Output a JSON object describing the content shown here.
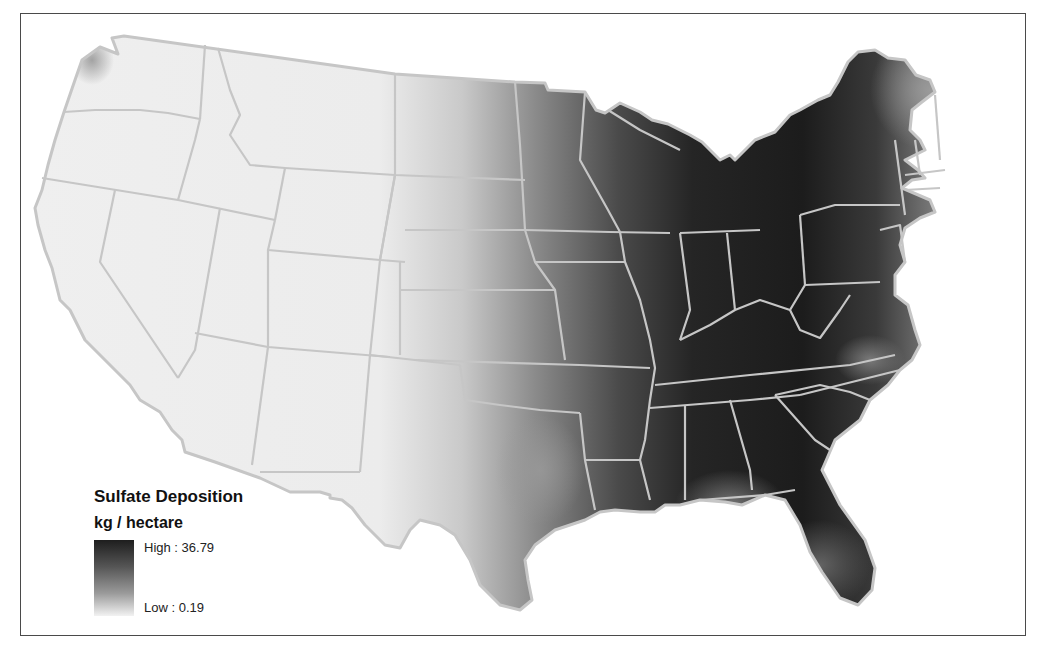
{
  "map": {
    "title": "Sulfate Deposition",
    "units": "kg / hectare",
    "region": "Contiguous United States",
    "colors": {
      "high": "#1e1e1e",
      "mid": "#7a7a7a",
      "low": "#f0f0f0",
      "state_border": "#c6c6c6",
      "frame": "#4a4a4a"
    }
  },
  "legend": {
    "title": "Sulfate Deposition",
    "units": "kg / hectare",
    "high_label": "High : 36.79",
    "low_label": "Low : 0.19",
    "high_value": 36.79,
    "low_value": 0.19
  }
}
